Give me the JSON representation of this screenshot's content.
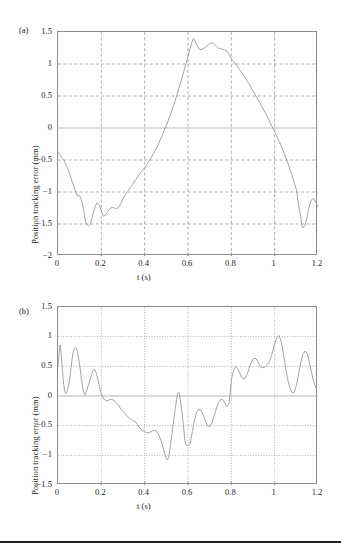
{
  "figure": {
    "background": "#ffffff",
    "line_color": "#9a9a9a",
    "axis_color": "#8c8c8c",
    "grid_color": "#9a9a9a",
    "text_color": "#231f20",
    "bottom_rule_color": "#231f20"
  },
  "chart_data": [
    {
      "type": "line",
      "panel_label": "(a)",
      "title": "",
      "xlabel": "t (s)",
      "ylabel": "Position tracking error (mm)",
      "xlim": [
        0,
        1.2
      ],
      "ylim": [
        -2,
        1.5
      ],
      "xticks": [
        0,
        0.2,
        0.4,
        0.6,
        0.8,
        1,
        1.2
      ],
      "xticklabels": [
        "0",
        "0.2",
        "0.4",
        "0.6",
        "0.8",
        "1",
        "1.2"
      ],
      "yticks": [
        -2,
        -1.5,
        -1,
        -0.5,
        0,
        0.5,
        1,
        1.5
      ],
      "yticklabels": [
        "-2",
        "-1.5",
        "-1",
        "-0.5",
        "0",
        "0.5",
        "1",
        "1.5"
      ],
      "grid": true,
      "grid_style": "dashed",
      "legend": null,
      "series": [
        {
          "name": "Position tracking error",
          "color": "#9a9a9a",
          "x": [
            0.0,
            0.01,
            0.02,
            0.03,
            0.04,
            0.05,
            0.06,
            0.07,
            0.08,
            0.09,
            0.1,
            0.11,
            0.12,
            0.13,
            0.14,
            0.15,
            0.16,
            0.17,
            0.18,
            0.19,
            0.2,
            0.21,
            0.22,
            0.23,
            0.24,
            0.25,
            0.26,
            0.27,
            0.28,
            0.29,
            0.3,
            0.32,
            0.34,
            0.36,
            0.38,
            0.4,
            0.42,
            0.44,
            0.46,
            0.48,
            0.5,
            0.52,
            0.54,
            0.56,
            0.57,
            0.58,
            0.59,
            0.6,
            0.61,
            0.62,
            0.625,
            0.63,
            0.64,
            0.65,
            0.66,
            0.67,
            0.68,
            0.69,
            0.7,
            0.71,
            0.72,
            0.73,
            0.74,
            0.75,
            0.76,
            0.77,
            0.78,
            0.79,
            0.8,
            0.82,
            0.84,
            0.86,
            0.88,
            0.9,
            0.92,
            0.94,
            0.96,
            0.98,
            1.0,
            1.02,
            1.04,
            1.06,
            1.08,
            1.1,
            1.11,
            1.12,
            1.125,
            1.13,
            1.14,
            1.15,
            1.16,
            1.17,
            1.18,
            1.19,
            1.2
          ],
          "y": [
            -0.38,
            -0.42,
            -0.47,
            -0.52,
            -0.6,
            -0.68,
            -0.78,
            -0.88,
            -0.98,
            -1.06,
            -1.06,
            -1.14,
            -1.32,
            -1.5,
            -1.53,
            -1.5,
            -1.36,
            -1.24,
            -1.17,
            -1.2,
            -1.3,
            -1.38,
            -1.36,
            -1.3,
            -1.26,
            -1.24,
            -1.25,
            -1.26,
            -1.24,
            -1.18,
            -1.1,
            -1.0,
            -0.9,
            -0.8,
            -0.7,
            -0.62,
            -0.52,
            -0.4,
            -0.28,
            -0.12,
            0.04,
            0.22,
            0.42,
            0.64,
            0.76,
            0.88,
            1.0,
            1.12,
            1.25,
            1.36,
            1.4,
            1.38,
            1.3,
            1.24,
            1.22,
            1.24,
            1.26,
            1.3,
            1.32,
            1.33,
            1.32,
            1.28,
            1.25,
            1.24,
            1.23,
            1.22,
            1.2,
            1.15,
            1.08,
            1.0,
            0.9,
            0.8,
            0.7,
            0.58,
            0.46,
            0.34,
            0.22,
            0.08,
            -0.06,
            -0.2,
            -0.36,
            -0.54,
            -0.74,
            -0.96,
            -1.2,
            -1.38,
            -1.52,
            -1.56,
            -1.52,
            -1.38,
            -1.22,
            -1.12,
            -1.1,
            -1.16,
            -1.24,
            -1.3
          ]
        }
      ]
    },
    {
      "type": "line",
      "panel_label": "(b)",
      "title": "",
      "xlabel": "t (s)",
      "ylabel": "Position tracking error (mm)",
      "xlim": [
        0,
        1.2
      ],
      "ylim": [
        -1.5,
        1.5
      ],
      "xticks": [
        0,
        0.2,
        0.4,
        0.6,
        0.8,
        1,
        1.2
      ],
      "xticklabels": [
        "0",
        "0.2",
        "0.4",
        "0.6",
        "0.8",
        "1",
        "1.2"
      ],
      "yticks": [
        -1.5,
        -1,
        -0.5,
        0,
        0.5,
        1,
        1.5
      ],
      "yticklabels": [
        "-1.5",
        "-1",
        "-0.5",
        "0",
        "0.5",
        "1",
        "1.5"
      ],
      "grid": true,
      "grid_style": "dotted",
      "legend": null,
      "series": [
        {
          "name": "Position tracking error",
          "color": "#9a9a9a",
          "x": [
            0.0,
            0.005,
            0.01,
            0.015,
            0.02,
            0.025,
            0.03,
            0.035,
            0.04,
            0.045,
            0.05,
            0.055,
            0.06,
            0.065,
            0.07,
            0.075,
            0.08,
            0.085,
            0.09,
            0.095,
            0.1,
            0.105,
            0.11,
            0.115,
            0.12,
            0.125,
            0.13,
            0.135,
            0.14,
            0.145,
            0.15,
            0.155,
            0.16,
            0.165,
            0.17,
            0.175,
            0.18,
            0.185,
            0.19,
            0.195,
            0.2,
            0.21,
            0.22,
            0.23,
            0.24,
            0.25,
            0.26,
            0.27,
            0.28,
            0.29,
            0.3,
            0.31,
            0.32,
            0.33,
            0.34,
            0.35,
            0.36,
            0.37,
            0.38,
            0.39,
            0.4,
            0.41,
            0.42,
            0.43,
            0.44,
            0.45,
            0.46,
            0.47,
            0.48,
            0.49,
            0.5,
            0.505,
            0.51,
            0.515,
            0.52,
            0.53,
            0.54,
            0.55,
            0.555,
            0.56,
            0.57,
            0.58,
            0.585,
            0.59,
            0.6,
            0.61,
            0.62,
            0.63,
            0.64,
            0.65,
            0.66,
            0.67,
            0.68,
            0.69,
            0.7,
            0.71,
            0.72,
            0.73,
            0.74,
            0.75,
            0.76,
            0.77,
            0.78,
            0.79,
            0.795,
            0.8,
            0.81,
            0.82,
            0.83,
            0.84,
            0.85,
            0.86,
            0.87,
            0.88,
            0.89,
            0.9,
            0.91,
            0.92,
            0.93,
            0.94,
            0.95,
            0.96,
            0.97,
            0.98,
            0.99,
            1.0,
            1.01,
            1.02,
            1.03,
            1.04,
            1.05,
            1.06,
            1.07,
            1.08,
            1.09,
            1.1,
            1.11,
            1.12,
            1.13,
            1.14,
            1.15,
            1.16,
            1.17,
            1.18,
            1.19
          ],
          "y": [
            0.5,
            0.72,
            0.86,
            0.7,
            0.45,
            0.24,
            0.1,
            0.04,
            0.06,
            0.12,
            0.2,
            0.32,
            0.48,
            0.62,
            0.74,
            0.8,
            0.82,
            0.8,
            0.74,
            0.64,
            0.52,
            0.38,
            0.24,
            0.12,
            0.04,
            0.02,
            0.06,
            0.12,
            0.18,
            0.24,
            0.3,
            0.36,
            0.42,
            0.45,
            0.44,
            0.4,
            0.34,
            0.26,
            0.18,
            0.1,
            0.03,
            -0.04,
            -0.08,
            -0.08,
            -0.06,
            -0.06,
            -0.08,
            -0.12,
            -0.16,
            -0.22,
            -0.26,
            -0.3,
            -0.34,
            -0.38,
            -0.4,
            -0.42,
            -0.44,
            -0.5,
            -0.55,
            -0.58,
            -0.6,
            -0.62,
            -0.62,
            -0.6,
            -0.58,
            -0.58,
            -0.62,
            -0.7,
            -0.8,
            -0.94,
            -1.06,
            -1.08,
            -1.04,
            -0.94,
            -0.8,
            -0.52,
            -0.24,
            0.0,
            0.06,
            0.04,
            -0.2,
            -0.54,
            -0.74,
            -0.82,
            -0.84,
            -0.8,
            -0.6,
            -0.4,
            -0.28,
            -0.22,
            -0.24,
            -0.32,
            -0.42,
            -0.5,
            -0.52,
            -0.46,
            -0.34,
            -0.22,
            -0.12,
            -0.06,
            -0.06,
            -0.12,
            -0.18,
            -0.12,
            0.06,
            0.28,
            0.42,
            0.5,
            0.46,
            0.38,
            0.3,
            0.28,
            0.34,
            0.44,
            0.55,
            0.62,
            0.64,
            0.6,
            0.52,
            0.48,
            0.48,
            0.5,
            0.54,
            0.62,
            0.74,
            0.88,
            0.98,
            1.02,
            0.92,
            0.72,
            0.48,
            0.28,
            0.14,
            0.06,
            0.06,
            0.18,
            0.36,
            0.56,
            0.7,
            0.76,
            0.72,
            0.58,
            0.4,
            0.24,
            0.14,
            0.12,
            0.2,
            0.32,
            0.38,
            0.3,
            0.26
          ]
        }
      ]
    }
  ]
}
